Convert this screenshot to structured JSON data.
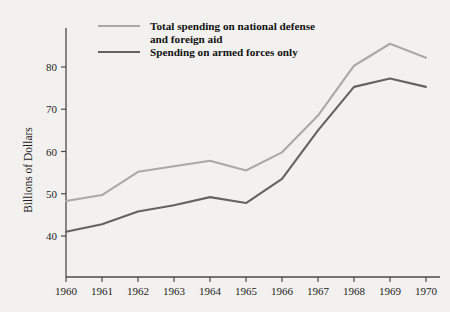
{
  "chart_data": {
    "type": "line",
    "title": "",
    "xlabel": "",
    "ylabel": "Billions of Dollars",
    "categories": [
      "1960",
      "1961",
      "1962",
      "1963",
      "1964",
      "1965",
      "1966",
      "1967",
      "1968",
      "1969",
      "1970"
    ],
    "x": [
      1960,
      1961,
      1962,
      1963,
      1964,
      1965,
      1966,
      1967,
      1968,
      1969,
      1970
    ],
    "xlim": [
      1960,
      1970
    ],
    "ylim": [
      33,
      88
    ],
    "yticks": [
      40,
      50,
      60,
      70,
      80
    ],
    "ytick_labels": [
      "40",
      "50",
      "60",
      "70",
      "80"
    ],
    "xtick_labels": [
      "1960",
      "1961",
      "1962",
      "1963",
      "1964",
      "1965",
      "1966",
      "1967",
      "1968",
      "1969",
      "1970"
    ],
    "grid": false,
    "legend_position": "top-left",
    "series": [
      {
        "name": "Total spending on national defense and foreign aid",
        "color": "#a9a9a9",
        "values": [
          48.3,
          49.7,
          55.2,
          56.5,
          57.8,
          55.5,
          59.8,
          68.5,
          80.3,
          85.5,
          82.2
        ]
      },
      {
        "name": "Spending on armed forces only",
        "color": "#636363",
        "values": [
          41.0,
          42.8,
          45.8,
          47.3,
          49.2,
          47.8,
          53.5,
          65.0,
          75.3,
          77.3,
          75.3
        ]
      }
    ],
    "legend": [
      {
        "label_line1": "Total spending on national defense",
        "label_line2": "and foreign aid",
        "color": "#a9a9a9"
      },
      {
        "label_line1": "Spending on armed forces only",
        "label_line2": "",
        "color": "#636363"
      }
    ],
    "background_color": "#f3f1ef",
    "axis_color": "#4a4a4a"
  }
}
